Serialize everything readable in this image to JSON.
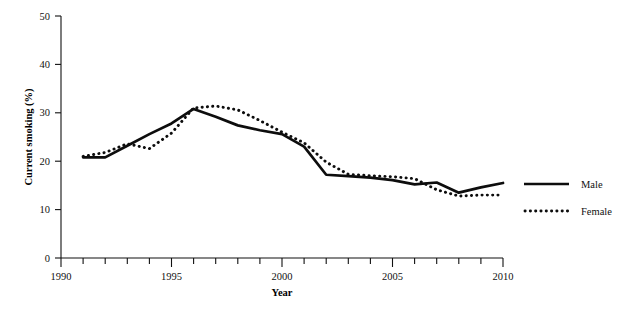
{
  "chart_data": {
    "type": "line",
    "title": "",
    "xlabel": "Year",
    "ylabel": "Current smoking (%)",
    "xlim": [
      1990,
      2010
    ],
    "ylim": [
      0,
      50
    ],
    "grid": false,
    "legend_position": "right",
    "x_ticks_major": [
      1990,
      1995,
      2000,
      2005,
      2010
    ],
    "x_tick_labels": [
      "1990",
      "1995",
      "2000",
      "2005",
      "2010"
    ],
    "x_ticks_minor_step": 1,
    "y_ticks": [
      0,
      10,
      20,
      30,
      40,
      50
    ],
    "y_tick_labels": [
      "0",
      "10",
      "20",
      "30",
      "40",
      "50"
    ],
    "x": [
      1991,
      1992,
      1993,
      1994,
      1995,
      1996,
      1997,
      1998,
      1999,
      2000,
      2001,
      2002,
      2003,
      2004,
      2005,
      2006,
      2007,
      2008,
      2009,
      2010
    ],
    "series": [
      {
        "name": "Male",
        "style": "solid",
        "color": "#0d0d0d",
        "values": [
          20.8,
          20.8,
          23.2,
          25.6,
          27.8,
          30.8,
          29.2,
          27.4,
          26.4,
          25.6,
          23.0,
          17.2,
          16.9,
          16.6,
          16.1,
          15.2,
          15.6,
          13.5,
          14.6,
          15.5
        ]
      },
      {
        "name": "Female",
        "style": "dotted",
        "color": "#0d0d0d",
        "values": [
          21.0,
          21.8,
          23.6,
          22.6,
          25.8,
          31.0,
          31.4,
          30.6,
          28.4,
          26.0,
          23.8,
          19.8,
          17.3,
          17.0,
          16.8,
          16.4,
          14.1,
          12.8,
          13.0,
          13.0
        ]
      }
    ]
  },
  "legend": {
    "items": [
      {
        "label": "Male"
      },
      {
        "label": "Female"
      }
    ]
  }
}
